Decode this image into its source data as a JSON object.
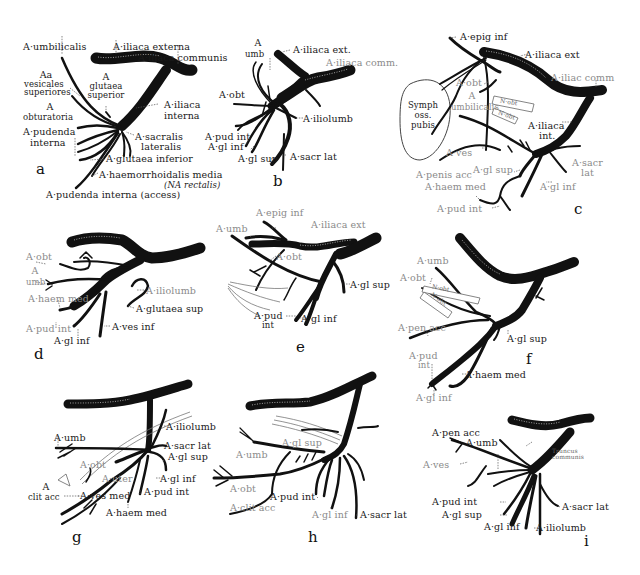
{
  "figure": {
    "panels": [
      {
        "id": "a",
        "letter": "a",
        "labels": {
          "umbilicalis": "A·umbilicalis",
          "iliaca_externa": "A·iliaca externa",
          "iliaca_communis": "A·iliaca communis",
          "vesicales_1": "Aa",
          "vesicales_2": "vesicales",
          "vesicales_3": "superiores",
          "glutaea_sup_1": "A",
          "glutaea_sup_2": "glutaea",
          "glutaea_sup_3": "superior",
          "obturatoria_1": "A",
          "obturatoria_2": "obturatoria",
          "iliaca_interna_1": "A·iliaca",
          "iliaca_interna_2": "interna",
          "pudenda_1": "A·pudenda",
          "pudenda_2": "interna",
          "sacralis_1": "A·sacralis",
          "sacralis_2": "lateralis",
          "glutaea_inferior": "A·glutaea inferior",
          "haemorrhoidalis": "A·haemorrhoidalis media",
          "rectalis": "(NA rectalis)",
          "pudenda_access": "A·pudenda interna (access)"
        }
      },
      {
        "id": "b",
        "letter": "b",
        "labels": {
          "umb_1": "A",
          "umb_2": "umb",
          "iliaca_ext": "A·iliaca ext.",
          "iliaca_comm": "A·iliaca comm.",
          "obt": "A·obt",
          "iliolumb": "A·iliolumb",
          "pud_int": "A·pud int",
          "gl_inf": "A·gl inf",
          "gl_sup": "A·gl sup",
          "sacr_lat": "A·sacr lat"
        }
      },
      {
        "id": "c",
        "letter": "c",
        "labels": {
          "epig_inf": "A·epig inf",
          "iliaca_ext": "A·iliaca ext",
          "iliac_comm": "A·iliac comm",
          "obt": "A·obt",
          "symph_1": "Symph",
          "symph_2": "oss.",
          "symph_3": "pubis",
          "umbilicalis_1": "A",
          "umbilicalis_2": "umbilicalis",
          "n_obt": "N·obt",
          "n_obt2": "N·obt",
          "iliaca_int_1": "A·iliaca",
          "iliaca_int_2": "int.",
          "ves": "A·ves",
          "penis_acc": "A·penis acc",
          "gl_sup": "A·gl sup",
          "sacr_lat_1": "A·sacr",
          "sacr_lat_2": "lat",
          "haem_med": "A·haem med",
          "gl_inf": "A·gl inf",
          "pud_int": "A·pud int"
        }
      },
      {
        "id": "d",
        "letter": "d",
        "labels": {
          "obt": "A·obt",
          "umb_1": "A",
          "umb_2": "umb",
          "haem_med": "A·haem med",
          "iliolumb": "A·iliolumb",
          "glutaea_sup": "A·glutaea sup",
          "pud_int": "A·pud int",
          "ves_inf": "A·ves inf",
          "gl_inf": "A·gl inf"
        }
      },
      {
        "id": "e",
        "letter": "e",
        "labels": {
          "epig_inf": "A·epig inf",
          "iliaca_ext": "A·iliaca ext",
          "umb": "A·umb",
          "obt": "A·obt",
          "gl_sup": "A·gl sup",
          "pud_1": "A·pud",
          "pud_2": "int",
          "gl_inf": "A·gl inf"
        }
      },
      {
        "id": "f",
        "letter": "f",
        "labels": {
          "umb": "A·umb",
          "obt": "A·obt",
          "n_obt": "N·obt",
          "n_obt2": "N·obt",
          "pen_acc": "A·pen acc",
          "gl_sup": "A·gl sup",
          "pud_1": "A·pud",
          "pud_2": "int",
          "haem_med": "A·haem med",
          "gl_inf": "A·gl inf"
        }
      },
      {
        "id": "g",
        "letter": "g",
        "labels": {
          "iliolumb": "A·iliolumb",
          "umb": "A·umb",
          "sacr_lat": "A·sacr lat",
          "gl_sup": "A·gl sup",
          "obt": "A·obt",
          "uter": "A·uter",
          "gl_inf": "A·gl inf",
          "clit_acc_1": "A",
          "clit_acc_2": "clit acc",
          "ves_med": "A·ves med",
          "pud_int": "A·pud int",
          "haem_med": "A·haem med"
        }
      },
      {
        "id": "h",
        "letter": "h",
        "labels": {
          "gl_sup": "A·gl sup",
          "umb": "A·umb",
          "obt": "A·obt",
          "pud_int": "A·pud int",
          "clit_acc": "A·clit acc",
          "gl_inf": "A·gl inf",
          "sacr_lat": "A·sacr lat"
        }
      },
      {
        "id": "i",
        "letter": "i",
        "labels": {
          "pen_acc": "A·pen acc",
          "umb": "A·umb",
          "ves": "A·ves",
          "tiny_1": "Truncus",
          "tiny_2": "communis",
          "pud_int": "A·pud int",
          "gl_sup": "A·gl sup",
          "sacr_lat": "A·sacr lat",
          "gl_inf": "A·gl inf",
          "iliolumb": "A·iliolumb"
        }
      }
    ]
  }
}
